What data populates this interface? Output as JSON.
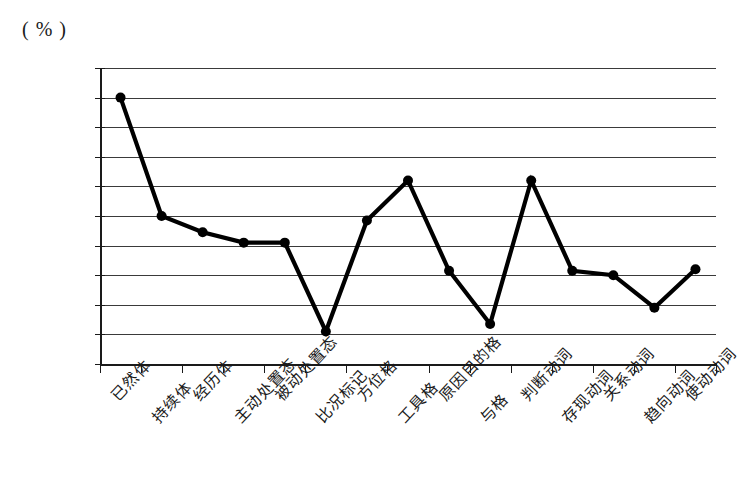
{
  "unit_label": "( % )",
  "chart_data": {
    "type": "line",
    "title": "",
    "subtitle": "",
    "xlabel": "",
    "ylabel": "( % )",
    "ylim": [
      0,
      100
    ],
    "ytick_step": 10,
    "yticks": [
      "100",
      "90",
      "80",
      "70",
      "60",
      "50",
      "40",
      "30",
      "20",
      "10",
      "0"
    ],
    "grid": true,
    "legend": "none",
    "marker": "filled-circle",
    "line_color": "#000000",
    "grid_color": "#3a3a3a",
    "axis_color": "#1a1a1a",
    "categories": [
      "已然体",
      "持续体",
      "经历体",
      "主动处置态",
      "被动处置态",
      "比况标记",
      "方位格",
      "工具格",
      "原因目的格",
      "与格",
      "判断动词",
      "存现动词",
      "关系动词",
      "趋向动词",
      "使动动词"
    ],
    "values": [
      90,
      50,
      44.5,
      41,
      41,
      11,
      48.5,
      62,
      31.5,
      13.5,
      62,
      31.5,
      30,
      19,
      32
    ]
  }
}
